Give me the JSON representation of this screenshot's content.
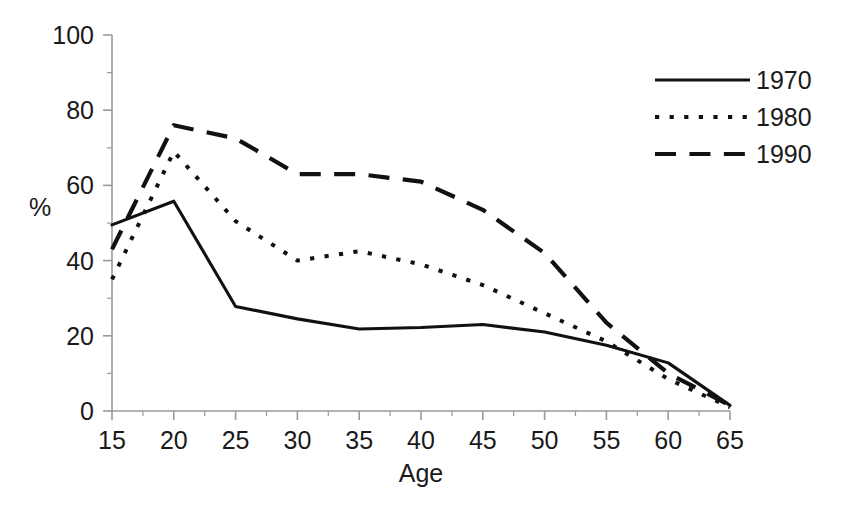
{
  "chart_data": {
    "type": "line",
    "title": "",
    "xlabel": "Age",
    "ylabel": "%",
    "xlim": [
      15,
      65
    ],
    "ylim": [
      0,
      100
    ],
    "x_ticks": [
      15,
      20,
      25,
      30,
      35,
      40,
      45,
      50,
      55,
      60,
      65
    ],
    "x_tick_labels": [
      "15",
      "20",
      "25",
      "30",
      "35",
      "40",
      "45",
      "50",
      "55",
      "60",
      "65"
    ],
    "y_ticks": [
      0,
      20,
      40,
      60,
      80,
      100
    ],
    "y_tick_labels": [
      "0",
      "20",
      "40",
      "60",
      "80",
      "100"
    ],
    "x_minor_step": 2.5,
    "y_minor_step": 10,
    "grid": false,
    "legend_position": "top-right",
    "x": [
      15,
      20,
      25,
      30,
      35,
      40,
      45,
      50,
      55,
      60,
      65
    ],
    "series": [
      {
        "name": "1970",
        "style": "solid",
        "color": "#111111",
        "values": [
          49.5,
          55.8,
          27.8,
          24.5,
          21.8,
          22.2,
          23.0,
          21.0,
          17.5,
          12.8,
          1.5
        ]
      },
      {
        "name": "1980",
        "style": "dotted",
        "color": "#111111",
        "values": [
          35.0,
          69.0,
          50.5,
          40.0,
          42.5,
          39.0,
          33.5,
          26.0,
          18.5,
          8.5,
          1.0
        ]
      },
      {
        "name": "1990",
        "style": "dashed",
        "color": "#111111",
        "values": [
          43.0,
          76.0,
          72.5,
          63.0,
          63.0,
          61.0,
          53.5,
          42.0,
          23.5,
          10.0,
          1.5
        ]
      }
    ]
  },
  "axis_style": {
    "axis_color": "#9a9a9a",
    "tick_color": "#9a9a9a",
    "background": "#ffffff"
  },
  "legend": {
    "entries": [
      {
        "label": "1970",
        "style": "solid"
      },
      {
        "label": "1980",
        "style": "dotted"
      },
      {
        "label": "1990",
        "style": "dashed"
      }
    ]
  }
}
